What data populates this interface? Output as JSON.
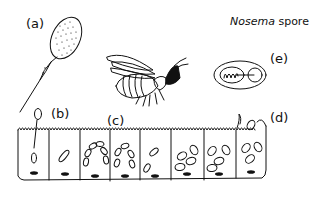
{
  "diagram": {
    "title_italic": "Nosema",
    "title_rest": " spore",
    "labels": {
      "a": "(a)",
      "b": "(b)",
      "c": "(c)",
      "d": "(d)",
      "e": "(e)"
    },
    "stroke_color": "#111111",
    "fill_color": "#ffffff"
  }
}
